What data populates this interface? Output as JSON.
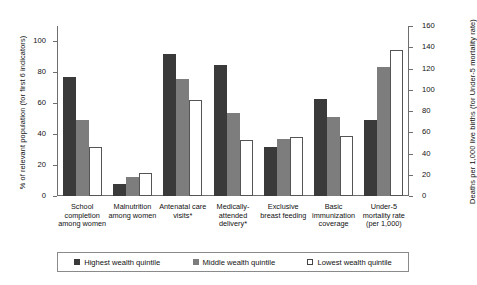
{
  "chart_data": {
    "type": "bar",
    "title": "",
    "subtitle": "",
    "xlabel": "",
    "ylabel": "% of relevant population (for first 6 indicators)",
    "ylabel_right": "Deaths per 1,000 live births (for Under-5 mortality rate)",
    "ylim": [
      0,
      110
    ],
    "ylim_right": [
      0,
      160
    ],
    "yticks": [
      0,
      20,
      40,
      60,
      80,
      100
    ],
    "yticks_right": [
      0,
      20,
      40,
      60,
      80,
      100,
      120,
      140,
      160
    ],
    "grid": false,
    "legend_position": "bottom",
    "categories": [
      "School completion among women",
      "Malnutrition among women",
      "Antenatal care visits*",
      "Medically-attended delivery*",
      "Exclusive breast feeding",
      "Basic immunization coverage",
      "Under-5 mortality rate (per 1,000)"
    ],
    "category_lines": [
      [
        "School",
        "completion",
        "among women"
      ],
      [
        "Malnutrition",
        "among women"
      ],
      [
        "Antenatal care",
        "visits*"
      ],
      [
        "Medically-",
        "attended",
        "delivery*"
      ],
      [
        "Exclusive",
        "breast feeding"
      ],
      [
        "Basic",
        "immunization",
        "coverage"
      ],
      [
        "Under-5",
        "mortality rate",
        "(per 1,000)"
      ]
    ],
    "series": [
      {
        "name": "Highest wealth quintile",
        "color": "#3a3a3a",
        "values": [
          77,
          8,
          92,
          85,
          32,
          63,
          72
        ],
        "axis": [
          "left",
          "left",
          "left",
          "left",
          "left",
          "left",
          "right"
        ]
      },
      {
        "name": "Middle wealth quintile",
        "color": "#7d7d7d",
        "values": [
          49,
          12,
          76,
          54,
          37,
          51,
          121
        ],
        "axis": [
          "left",
          "left",
          "left",
          "left",
          "left",
          "left",
          "right"
        ]
      },
      {
        "name": "Lowest wealth quintile",
        "color": "#ffffff",
        "values": [
          32,
          15,
          62,
          36,
          38,
          39,
          137
        ],
        "axis": [
          "left",
          "left",
          "left",
          "left",
          "left",
          "left",
          "right"
        ]
      }
    ]
  },
  "legend": {
    "items": [
      {
        "label": "Highest wealth quintile"
      },
      {
        "label": "Middle wealth quintile"
      },
      {
        "label": "Lowest wealth quintile"
      }
    ]
  },
  "axes": {
    "left_labels": [
      "0",
      "20",
      "40",
      "60",
      "80",
      "100"
    ],
    "right_labels": [
      "0",
      "20",
      "40",
      "60",
      "80",
      "100",
      "120",
      "140",
      "160"
    ]
  }
}
